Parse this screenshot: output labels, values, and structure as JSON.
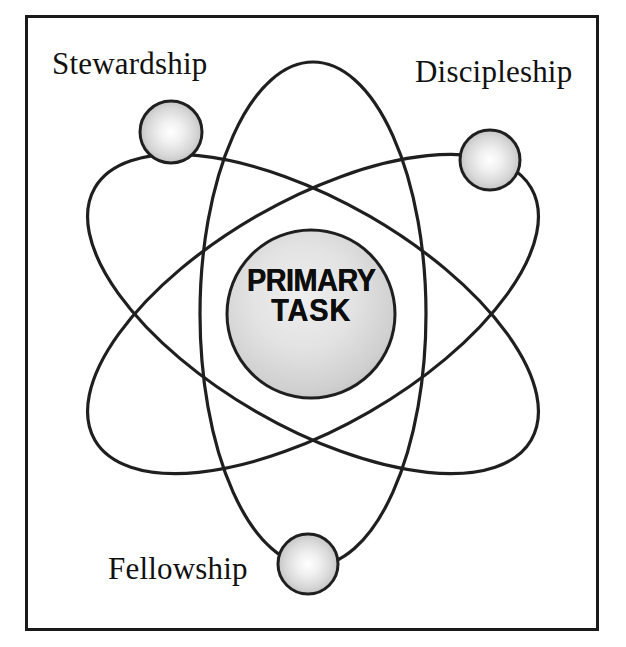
{
  "diagram": {
    "type": "atom-orbital-diagram",
    "core": {
      "label_line_1": "PRIMARY",
      "label_line_2": "TASK",
      "shape": "sphere",
      "center": [
        311,
        314
      ],
      "radius": 84,
      "fill_center_color": "#f2f2f2",
      "fill_edge_color": "#b9b9b9",
      "stroke_color": "#1a1a1a"
    },
    "nodes": [
      {
        "id": "stewardship",
        "label": "Stewardship",
        "center": [
          171,
          132
        ],
        "radius": 31,
        "label_position": "above-left"
      },
      {
        "id": "discipleship",
        "label": "Discipleship",
        "center": [
          490,
          160
        ],
        "radius": 30,
        "label_position": "above-right"
      },
      {
        "id": "fellowship",
        "label": "Fellowship",
        "center": [
          308,
          564
        ],
        "radius": 30,
        "label_position": "left"
      }
    ],
    "orbits": [
      {
        "id": "orbit-1",
        "rotation_deg": 0,
        "rx": 113,
        "ry": 252
      },
      {
        "id": "orbit-2",
        "rotation_deg": 60,
        "rx": 113,
        "ry": 252
      },
      {
        "id": "orbit-3",
        "rotation_deg": 120,
        "rx": 113,
        "ry": 252
      }
    ],
    "frame": {
      "stroke_color": "#1a1a1a",
      "stroke_width": 3,
      "background": "#ffffff"
    },
    "colors": {
      "ink": "#1a1a1a",
      "page": "#ffffff",
      "sphere_highlight": "#ffffff",
      "sphere_shade": "#9e9e9e"
    }
  }
}
